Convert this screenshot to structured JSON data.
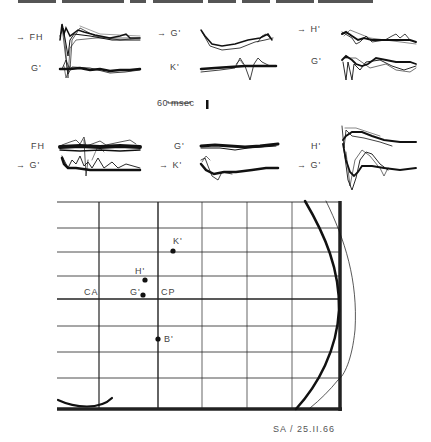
{
  "header": {
    "truncated_title_text": ""
  },
  "traces": {
    "top_row": [
      {
        "upper_label": "FH",
        "upper_marked": true,
        "lower_label": "G'",
        "lower_marked": false
      },
      {
        "upper_label": "G'",
        "upper_marked": true,
        "lower_label": "K'",
        "lower_marked": false
      },
      {
        "upper_label": "H'",
        "upper_marked": true,
        "lower_label": "G'",
        "lower_marked": false
      }
    ],
    "bottom_row": [
      {
        "upper_label": "FH",
        "upper_marked": false,
        "lower_label": "G'",
        "lower_marked": true
      },
      {
        "upper_label": "G'",
        "upper_marked": false,
        "lower_label": "K'",
        "lower_marked": true
      },
      {
        "upper_label": "H'",
        "upper_marked": false,
        "lower_label": "G'",
        "lower_marked": true
      }
    ],
    "arrow_glyph": "→"
  },
  "scale_bar": {
    "time_label": "60 msec"
  },
  "map": {
    "landmarks": [
      {
        "label": "CA"
      },
      {
        "label": "CP"
      }
    ],
    "points": [
      {
        "label": "K'"
      },
      {
        "label": "H'"
      },
      {
        "label": "G'"
      },
      {
        "label": "B'"
      }
    ]
  },
  "caption": {
    "text": "SA / 25.II.66"
  },
  "colors": {
    "ink": "#111111",
    "grid": "#222222",
    "label": "#444444",
    "background": "#ffffff"
  }
}
